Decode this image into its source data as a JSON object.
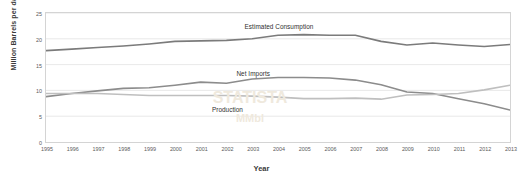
{
  "chart_data": {
    "type": "line",
    "title": "",
    "xlabel": "Year",
    "ylabel": "Million Barrels per day (MMbbl)",
    "x": [
      1995,
      1996,
      1997,
      1998,
      1999,
      2000,
      2001,
      2002,
      2003,
      2004,
      2005,
      2006,
      2007,
      2008,
      2009,
      2010,
      2011,
      2012,
      2013
    ],
    "xtick_labels": [
      "1995",
      "1996",
      "1997",
      "1998",
      "1999",
      "2000",
      "2001",
      "2002",
      "2003",
      "2004",
      "2005",
      "2006",
      "2007",
      "2008",
      "2009",
      "2010",
      "2011",
      "2012",
      "2013"
    ],
    "ytick_labels": [
      "0",
      "5",
      "10",
      "15",
      "20",
      "25"
    ],
    "ytick_values": [
      0,
      5,
      10,
      15,
      20,
      25
    ],
    "ylim": [
      0,
      25
    ],
    "xlim": [
      1995,
      2013
    ],
    "grid": true,
    "legend": "inline-labels",
    "series": [
      {
        "name": "Estimated Consumption",
        "color": "#7b7b7b",
        "label_x": 2004,
        "label_y": 22.6,
        "values": [
          17.7,
          18.0,
          18.3,
          18.6,
          19.0,
          19.5,
          19.6,
          19.7,
          20.0,
          20.7,
          20.8,
          20.7,
          20.7,
          19.5,
          18.8,
          19.2,
          18.8,
          18.5,
          18.9
        ]
      },
      {
        "name": "Net Imports",
        "color": "#8c8c8c",
        "label_x": 2003,
        "label_y": 13.6,
        "values": [
          8.8,
          9.4,
          9.9,
          10.4,
          10.5,
          11.0,
          11.6,
          11.4,
          12.2,
          12.5,
          12.5,
          12.4,
          12.0,
          11.1,
          9.7,
          9.4,
          8.4,
          7.4,
          6.2
        ]
      },
      {
        "name": "Production",
        "color": "#bfbfbf",
        "label_x": 2002,
        "label_y": 6.6,
        "values": [
          9.4,
          9.4,
          9.4,
          9.2,
          9.0,
          9.0,
          9.0,
          9.0,
          8.9,
          8.7,
          8.4,
          8.4,
          8.5,
          8.3,
          9.1,
          9.2,
          9.4,
          10.1,
          11.0
        ]
      }
    ]
  },
  "watermarks": [
    {
      "text": "STATISTA",
      "x": 250,
      "y": 98,
      "size": 16,
      "rotate": 0
    },
    {
      "text": "MMbl",
      "x": 250,
      "y": 118,
      "size": 11,
      "rotate": 0
    }
  ]
}
